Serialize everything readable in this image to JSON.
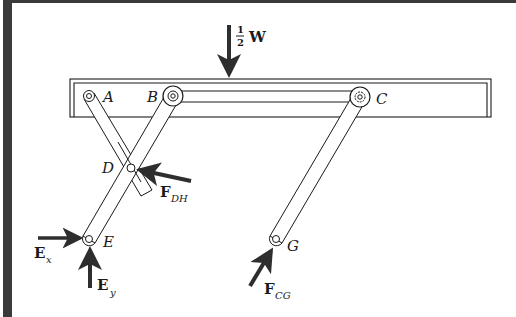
{
  "figure": {
    "type": "mechanism free-body diagram",
    "frame_color": "#3a3a3a",
    "line_color": "#1a1a1a",
    "arrow_color": "#2e2e2e"
  },
  "points": {
    "A": "A",
    "B": "B",
    "C": "C",
    "D": "D",
    "E": "E",
    "G": "G"
  },
  "forces": {
    "weight": {
      "numerator": "1",
      "denominator": "2",
      "symbol": "W"
    },
    "f_dh": {
      "symbol": "F",
      "subscript": "DH"
    },
    "e_x": {
      "symbol": "E",
      "subscript": "x"
    },
    "e_y": {
      "symbol": "E",
      "subscript": "y"
    },
    "f_cg": {
      "symbol": "F",
      "subscript": "CG"
    }
  }
}
